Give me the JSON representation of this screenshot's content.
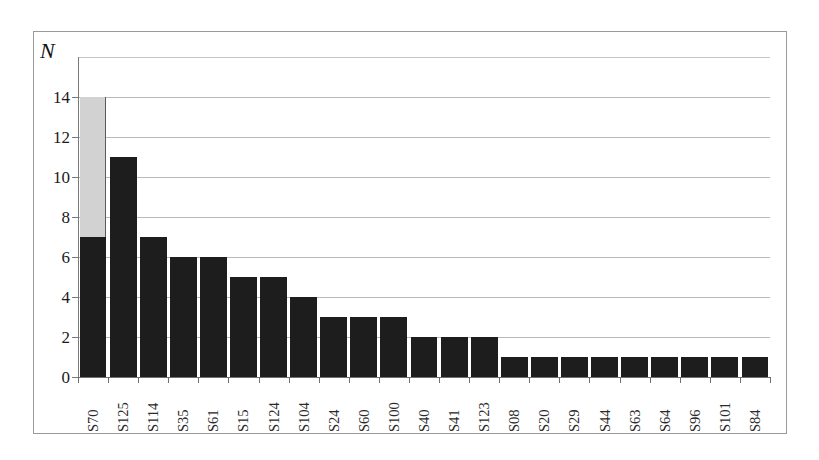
{
  "chart_data": {
    "type": "bar",
    "title": "",
    "subtitle": "",
    "xlabel": "",
    "ylabel": "N",
    "ylim": [
      0,
      16
    ],
    "yticks": [
      0,
      2,
      4,
      6,
      8,
      10,
      12,
      14
    ],
    "ytick_labels": [
      "0",
      "2",
      "4",
      "6",
      "8",
      "10",
      "12",
      "14"
    ],
    "grid": "horizontal",
    "legend": "none",
    "bar_colors": {
      "primary": "#1d1d1d",
      "secondary": "#d2d2d2"
    },
    "categories": [
      "S70",
      "S125",
      "S114",
      "S35",
      "S61",
      "S15",
      "S124",
      "S104",
      "S24",
      "S60",
      "S100",
      "S40",
      "S41",
      "S123",
      "S08",
      "S20",
      "S29",
      "S44",
      "S63",
      "S64",
      "S96",
      "S101",
      "S84"
    ],
    "series": [
      {
        "name": "dark",
        "color": "#1d1d1d",
        "values": [
          7,
          11,
          7,
          6,
          6,
          5,
          5,
          4,
          3,
          3,
          3,
          2,
          2,
          2,
          1,
          1,
          1,
          1,
          1,
          1,
          1,
          1,
          1
        ]
      },
      {
        "name": "light",
        "color": "#d2d2d2",
        "values": [
          7,
          0,
          0,
          0,
          0,
          0,
          0,
          0,
          0,
          0,
          0,
          0,
          0,
          0,
          0,
          0,
          0,
          0,
          0,
          0,
          0,
          0,
          0
        ]
      }
    ],
    "totals": [
      14,
      11,
      7,
      6,
      6,
      5,
      5,
      4,
      3,
      3,
      3,
      2,
      2,
      2,
      1,
      1,
      1,
      1,
      1,
      1,
      1,
      1,
      1
    ]
  }
}
